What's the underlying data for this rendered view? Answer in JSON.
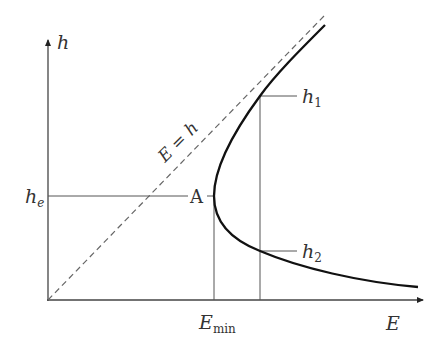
{
  "diagram": {
    "axes": {
      "y_label": "h",
      "x_label": "E"
    },
    "lines": {
      "diagonal_label": "E = h",
      "diagonal_style": "dashed"
    },
    "points": {
      "nose_label": "A",
      "h_e_label_main": "h",
      "h_e_label_sub": "e",
      "h1_label_main": "h",
      "h1_label_sub": "1",
      "h2_label_main": "h",
      "h2_label_sub": "2",
      "e_min_label_main": "E",
      "e_min_label_sub": "min"
    },
    "colors": {
      "axis": "#444444",
      "curve": "#111111",
      "guide": "#555555",
      "dashed": "#666666",
      "text": "#333333"
    }
  }
}
